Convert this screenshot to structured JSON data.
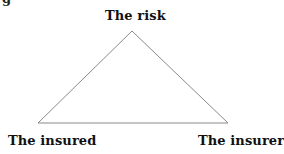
{
  "figure": {
    "caption_fragment": "g",
    "nodes": [
      {
        "id": "risk",
        "label": "The risk",
        "position": "top"
      },
      {
        "id": "insured",
        "label": "The insured",
        "position": "bottom-left"
      },
      {
        "id": "insurer",
        "label": "The insurer",
        "position": "bottom-right"
      }
    ],
    "edges": [
      {
        "from": "risk",
        "to": "insured"
      },
      {
        "from": "risk",
        "to": "insurer"
      },
      {
        "from": "insured",
        "to": "insurer"
      }
    ],
    "line_color": "#8a8a8a"
  }
}
